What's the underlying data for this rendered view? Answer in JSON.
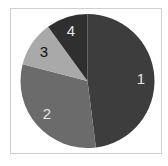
{
  "chart_data": {
    "type": "pie",
    "title": "",
    "categories": [
      "1",
      "2",
      "3",
      "4"
    ],
    "values": [
      48,
      31,
      11,
      10
    ],
    "unit": "percent (estimated from slice angles)",
    "start_angle": "12 o'clock",
    "direction": "clockwise",
    "legend": "none",
    "colors": [
      "#3d3d3d",
      "#6b6b6b",
      "#a9a9a9",
      "#2f2f2f"
    ],
    "label_colors": [
      "#e6e6e6",
      "#e6e6e6",
      "#111111",
      "#e6e6e6"
    ]
  },
  "labels": {
    "slice1": "1",
    "slice2": "2",
    "slice3": "3",
    "slice4": "4"
  }
}
